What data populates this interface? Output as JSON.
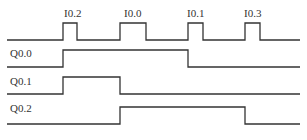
{
  "diagram": {
    "type": "timing-diagram",
    "colors": {
      "line": "#333333",
      "text": "#333333",
      "background": "#ffffff"
    },
    "inputs": {
      "label": "",
      "pulses": [
        {
          "name": "I0.2",
          "start": 63,
          "end": 77
        },
        {
          "name": "I0.0",
          "start": 120,
          "end": 146
        },
        {
          "name": "I0.1",
          "start": 188,
          "end": 203
        },
        {
          "name": "I0.3",
          "start": 245,
          "end": 260
        }
      ]
    },
    "outputs": [
      {
        "name": "Q0.0",
        "high_intervals": [
          [
            63,
            188
          ]
        ]
      },
      {
        "name": "Q0.1",
        "high_intervals": [
          [
            63,
            120
          ]
        ]
      },
      {
        "name": "Q0.2",
        "high_intervals": [
          [
            120,
            245
          ]
        ]
      }
    ]
  }
}
